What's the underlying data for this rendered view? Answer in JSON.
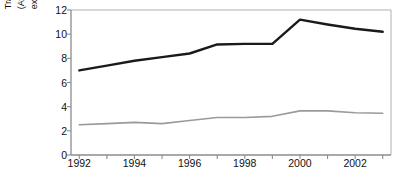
{
  "chart_data": {
    "type": "line",
    "title": "",
    "xlabel": "",
    "ylabel": "Trade integration index (Average value of imports and exports divided by GDP X 100)",
    "ylabel_lines": [
      "Trade integration index",
      "(Average value of imports and",
      "exports divided by GDP X 100)"
    ],
    "x": [
      1992,
      1993,
      1994,
      1995,
      1996,
      1997,
      1998,
      1999,
      2000,
      2001,
      2002,
      2003
    ],
    "xtick_labels": [
      "1992",
      "1994",
      "1996",
      "1998",
      "2000",
      "2002"
    ],
    "xtick_values": [
      1992,
      1994,
      1996,
      1998,
      2000,
      2002
    ],
    "ytick_labels": [
      "0",
      "2",
      "4",
      "6",
      "8",
      "10",
      "12"
    ],
    "ytick_values": [
      0,
      2,
      4,
      6,
      8,
      10,
      12
    ],
    "xlim": [
      1991.7,
      2003.3
    ],
    "ylim": [
      0,
      12
    ],
    "grid": false,
    "legend": "none",
    "series": [
      {
        "name": "upper-series",
        "color": "#1a1a1a",
        "width": 2.4,
        "values": [
          7.0,
          7.4,
          7.8,
          8.1,
          8.4,
          9.15,
          9.2,
          9.2,
          11.2,
          10.8,
          10.45,
          10.2
        ]
      },
      {
        "name": "lower-series",
        "color": "#9a9a9a",
        "width": 1.6,
        "values": [
          2.5,
          2.6,
          2.7,
          2.6,
          2.85,
          3.1,
          3.1,
          3.2,
          3.65,
          3.65,
          3.5,
          3.45
        ]
      }
    ],
    "axis_color": "#8c8c8c",
    "frame_color": "#b0b0b0",
    "background": "#ffffff"
  }
}
